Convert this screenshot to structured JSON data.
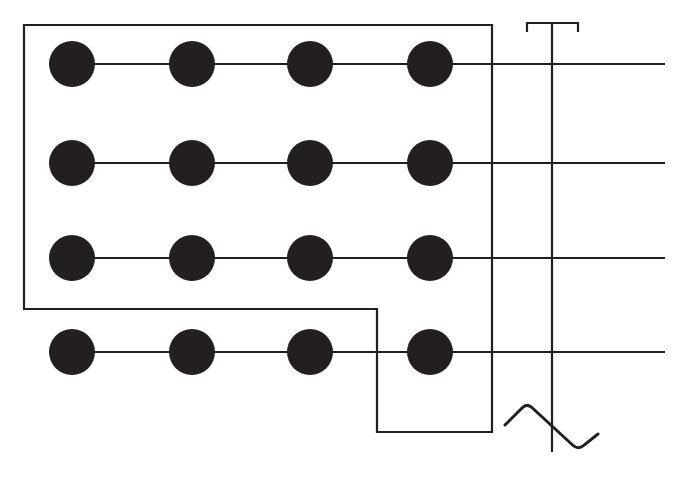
{
  "canvas": {
    "width": 694,
    "height": 489,
    "background_color": "#ffffff"
  },
  "style": {
    "stroke_color": "#231f20",
    "node_fill_color": "#231f20",
    "line_width": 2.2,
    "wave_line_width": 3.0,
    "node_radius": 23
  },
  "diagram": {
    "type": "schematic-line-drawing",
    "node_rows": [
      {
        "row_id": "row-1",
        "rail_y": 64,
        "rail_x_start": 72,
        "rail_x_end": 665,
        "nodes": [
          {
            "node_id": "node-r1-c1",
            "cx": 72,
            "cy": 64,
            "r": 23
          },
          {
            "node_id": "node-r1-c2",
            "cx": 192,
            "cy": 64,
            "r": 23
          },
          {
            "node_id": "node-r1-c3",
            "cx": 310,
            "cy": 64,
            "r": 23
          },
          {
            "node_id": "node-r1-c4",
            "cx": 430,
            "cy": 64,
            "r": 23
          }
        ]
      },
      {
        "row_id": "row-2",
        "rail_y": 163,
        "rail_x_start": 72,
        "rail_x_end": 665,
        "nodes": [
          {
            "node_id": "node-r2-c1",
            "cx": 72,
            "cy": 163,
            "r": 23
          },
          {
            "node_id": "node-r2-c2",
            "cx": 192,
            "cy": 163,
            "r": 23
          },
          {
            "node_id": "node-r2-c3",
            "cx": 310,
            "cy": 163,
            "r": 23
          },
          {
            "node_id": "node-r2-c4",
            "cx": 430,
            "cy": 163,
            "r": 23
          }
        ]
      },
      {
        "row_id": "row-3",
        "rail_y": 258,
        "rail_x_start": 72,
        "rail_x_end": 665,
        "nodes": [
          {
            "node_id": "node-r3-c1",
            "cx": 72,
            "cy": 258,
            "r": 23
          },
          {
            "node_id": "node-r3-c2",
            "cx": 192,
            "cy": 258,
            "r": 23
          },
          {
            "node_id": "node-r3-c3",
            "cx": 310,
            "cy": 258,
            "r": 23
          },
          {
            "node_id": "node-r3-c4",
            "cx": 430,
            "cy": 258,
            "r": 23
          }
        ]
      },
      {
        "row_id": "row-4",
        "rail_y": 352,
        "rail_x_start": 72,
        "rail_x_end": 665,
        "nodes": [
          {
            "node_id": "node-r4-c1",
            "cx": 72,
            "cy": 352,
            "r": 23
          },
          {
            "node_id": "node-r4-c2",
            "cx": 192,
            "cy": 352,
            "r": 23
          },
          {
            "node_id": "node-r4-c3",
            "cx": 310,
            "cy": 352,
            "r": 23
          },
          {
            "node_id": "node-r4-c4",
            "cx": 430,
            "cy": 352,
            "r": 23
          }
        ]
      }
    ],
    "outline_path": "M 377 432 L 492 432 L 492 25 L 24 25 L 24 309 L 377 309 Z",
    "outline_corners": [
      {
        "x": 377,
        "y": 432
      },
      {
        "x": 492,
        "y": 432
      },
      {
        "x": 492,
        "y": 25
      },
      {
        "x": 24,
        "y": 25
      },
      {
        "x": 24,
        "y": 309
      },
      {
        "x": 377,
        "y": 309
      }
    ],
    "trunk_line": {
      "x": 552,
      "y_top": 23,
      "y_bottom": 452
    },
    "top_bracket": {
      "y": 23,
      "x_left": 527,
      "x_right": 578,
      "tick_depth": 9,
      "path": "M 527 32 L 527 23 L 578 23 L 578 32"
    },
    "wave": {
      "path": "M 505 425 L 527 403 L 578 450 L 598 434",
      "points": [
        {
          "x": 505,
          "y": 425
        },
        {
          "x": 527,
          "y": 403
        },
        {
          "x": 578,
          "y": 450
        },
        {
          "x": 598,
          "y": 434
        }
      ],
      "corner_rounding": 7
    }
  }
}
